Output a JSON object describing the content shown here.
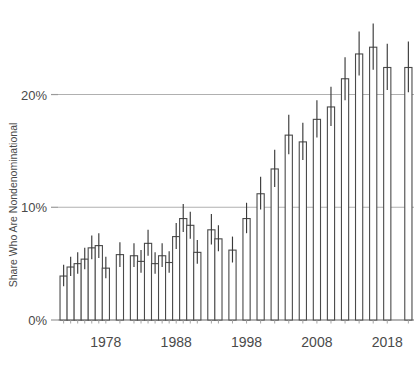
{
  "chart_data": {
    "type": "bar",
    "title": "",
    "subtitle": "",
    "xlabel": "",
    "ylabel": "Share Who Are Nondenominational",
    "ylim": [
      0,
      27.5
    ],
    "xlim": [
      1971.2,
      2021.8
    ],
    "grid": "horizontal gridlines at 10% and 20%; baseline at 0%",
    "legend": "none",
    "error_bars": "vertical 95% confidence intervals drawn as thin lines through each bar top",
    "bar_style": "white fill with dark gray outline",
    "y_ticks": [
      0,
      10,
      20
    ],
    "y_tick_labels": [
      "0%",
      "10%",
      "20%"
    ],
    "x_ticks": [
      1978,
      1988,
      1998,
      2008,
      2018
    ],
    "x_tick_labels": [
      "1978",
      "1988",
      "1998",
      "2008",
      "2018"
    ],
    "categories": [
      1972,
      1973,
      1974,
      1975,
      1976,
      1977,
      1978,
      1980,
      1982,
      1983,
      1984,
      1985,
      1986,
      1987,
      1988,
      1989,
      1990,
      1991,
      1993,
      1994,
      1996,
      1998,
      2000,
      2002,
      2004,
      2006,
      2008,
      2010,
      2012,
      2014,
      2016,
      2018,
      2021
    ],
    "values": [
      3.9,
      4.7,
      5.0,
      5.4,
      6.4,
      6.6,
      4.6,
      5.8,
      5.7,
      5.2,
      6.8,
      5.0,
      5.7,
      5.1,
      7.4,
      9.0,
      8.4,
      6.0,
      8.0,
      7.2,
      6.2,
      9.0,
      11.2,
      13.4,
      16.4,
      15.8,
      17.8,
      18.9,
      21.4,
      23.6,
      24.2,
      22.4,
      22.4
    ],
    "errors_low": [
      3.0,
      3.9,
      4.1,
      4.5,
      5.4,
      5.5,
      3.7,
      4.7,
      4.7,
      4.2,
      5.7,
      4.1,
      4.7,
      4.2,
      6.3,
      7.8,
      7.2,
      5.0,
      6.7,
      6.1,
      5.1,
      7.7,
      9.8,
      11.8,
      14.7,
      14.2,
      16.2,
      17.2,
      19.5,
      21.7,
      22.2,
      20.4,
      20.2
    ],
    "errors_high": [
      4.9,
      5.6,
      6.0,
      6.4,
      7.5,
      7.7,
      5.6,
      6.9,
      6.8,
      6.2,
      8.0,
      6.0,
      6.8,
      6.1,
      8.6,
      10.3,
      9.6,
      7.1,
      9.4,
      8.4,
      7.4,
      10.4,
      12.7,
      15.1,
      18.2,
      17.5,
      19.5,
      20.7,
      23.3,
      25.6,
      26.3,
      24.5,
      24.7
    ]
  },
  "axis": {
    "y_label": "Share Who Are Nondenominational",
    "y_tick_0": "0%",
    "y_tick_10": "10%",
    "y_tick_20": "20%",
    "x_tick_1978": "1978",
    "x_tick_1988": "1988",
    "x_tick_1998": "1998",
    "x_tick_2008": "2008",
    "x_tick_2018": "2018"
  },
  "colors": {
    "bar_fill": "#ffffff",
    "bar_stroke": "#4a4a4a",
    "error_bar": "#3a3a3a",
    "gridline": "#b0b0b0",
    "axis_text": "#4a4a4a",
    "background": "#ffffff"
  }
}
